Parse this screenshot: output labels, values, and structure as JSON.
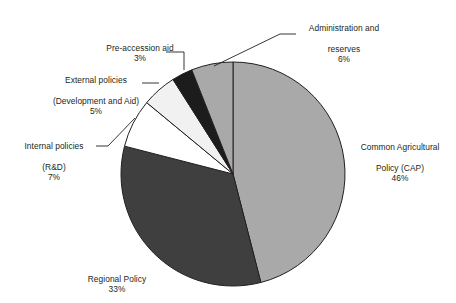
{
  "chart_data": {
    "type": "pie",
    "title": "",
    "subtitle": "",
    "xlabel": "",
    "ylabel": "",
    "legend_position": "labels-outside",
    "grid": false,
    "start_angle_deg": 0,
    "direction": "clockwise",
    "units": "percent",
    "total": 100,
    "categories": [
      "Common Agricultural Policy (CAP)",
      "Regional Policy",
      "Internal policies (R&D)",
      "External policies (Development and Aid)",
      "Pre-accession aid",
      "Administration and reserves"
    ],
    "values": [
      46,
      33,
      7,
      5,
      3,
      6
    ],
    "slices": [
      {
        "id": "cap",
        "name": "Common Agricultural Policy (CAP)",
        "label_line1": "Common Agricultural",
        "label_line2": "Policy (CAP)",
        "value": 46,
        "percent_text": "46%",
        "color": "#a9a9a9"
      },
      {
        "id": "regional",
        "name": "Regional Policy",
        "label_line1": "Regional Policy",
        "label_line2": "",
        "value": 33,
        "percent_text": "33%",
        "color": "#3f3f3f"
      },
      {
        "id": "internal",
        "name": "Internal policies (R&D)",
        "label_line1": "Internal policies",
        "label_line2": "(R&D)",
        "value": 7,
        "percent_text": "7%",
        "color": "#ffffff"
      },
      {
        "id": "external",
        "name": "External policies (Development and Aid)",
        "label_line1": "External policies",
        "label_line2": "(Development and Aid)",
        "value": 5,
        "percent_text": "5%",
        "color": "#f1f1f1"
      },
      {
        "id": "preaccession",
        "name": "Pre-accession aid",
        "label_line1": "Pre-accession aid",
        "label_line2": "",
        "value": 3,
        "percent_text": "3%",
        "color": "#1c1c1c"
      },
      {
        "id": "administration",
        "name": "Administration and reserves",
        "label_line1": "Administration and",
        "label_line2": "reserves",
        "value": 6,
        "percent_text": "6%",
        "color": "#a9a9a9"
      }
    ],
    "colors": {
      "outline": "#231f20",
      "leader_line": "#231f20",
      "text": "#231f20",
      "background": "#ffffff"
    }
  }
}
